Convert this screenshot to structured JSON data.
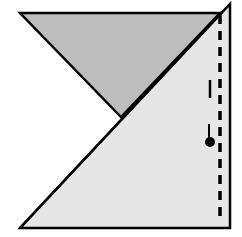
{
  "diagram": {
    "colors": {
      "background": "#ffffff",
      "dark_triangle_fill": "#bdbdbd",
      "light_triangle_fill": "#e6e6e6",
      "stroke": "#000000"
    },
    "dark_triangle": {
      "points": "20,13 220,13 121,117"
    },
    "light_triangle": {
      "points": "20,228 230,228 230,4"
    },
    "dashed_line": {
      "x": 220,
      "y1": 15,
      "y2": 222,
      "dash": "9,7"
    },
    "solid_tick": {
      "x": 210,
      "y1": 80,
      "y2": 98
    },
    "dot_marker": {
      "cx": 210,
      "cy": 142,
      "r": 5,
      "stem_y1": 124
    }
  }
}
